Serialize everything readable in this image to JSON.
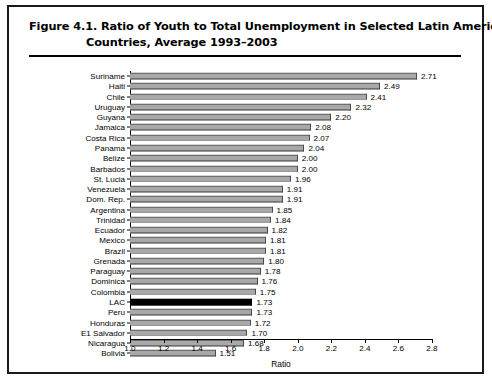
{
  "figure": {
    "label": "Figure 4.1.",
    "title_line1": "Figure 4.1.  Ratio of Youth to Total Unemployment in Selected Latin American",
    "title_line2": "Countries, Average 1993–2003"
  },
  "chart_data": {
    "type": "bar",
    "orientation": "horizontal",
    "title": "Figure 4.1.  Ratio of Youth to Total Unemployment in Selected Latin American Countries, Average 1993–2003",
    "xlabel": "Ratio",
    "ylabel": "",
    "xlim": [
      1.0,
      2.8
    ],
    "xticks": [
      "1.0",
      "1.2",
      "1.4",
      "1.6",
      "1.8",
      "2.0",
      "2.2",
      "2.4",
      "2.6",
      "2.8"
    ],
    "xtick_values": [
      1.0,
      1.2,
      1.4,
      1.6,
      1.8,
      2.0,
      2.2,
      2.4,
      2.6,
      2.8
    ],
    "grid": false,
    "legend": null,
    "highlight_category": "LAC",
    "highlight_color": "#000000",
    "bar_color": "#a8a8a8",
    "categories": [
      "Suriname",
      "Haiti",
      "Chile",
      "Uruguay",
      "Guyana",
      "Jamaica",
      "Costa Rica",
      "Panama",
      "Belize",
      "Barbados",
      "St. Lucia",
      "Venezuela",
      "Dom. Rep.",
      "Argentina",
      "Trinidad",
      "Ecuador",
      "Mexico",
      "Brazil",
      "Grenada",
      "Paraguay",
      "Dominica",
      "Colombia",
      "LAC",
      "Peru",
      "Honduras",
      "E1 Salvador",
      "Nicaragua",
      "Bolivia"
    ],
    "values": [
      2.71,
      2.49,
      2.41,
      2.32,
      2.2,
      2.08,
      2.07,
      2.04,
      2.0,
      2.0,
      1.96,
      1.91,
      1.91,
      1.85,
      1.84,
      1.82,
      1.81,
      1.81,
      1.8,
      1.78,
      1.76,
      1.75,
      1.73,
      1.73,
      1.72,
      1.7,
      1.68,
      1.51
    ],
    "value_labels": [
      "2.71",
      "2.49",
      "2.41",
      "2.32",
      "2.20",
      "2.08",
      "2.07",
      "2.04",
      "2.00",
      "2.00",
      "1.96",
      "1.91",
      "1.91",
      "1.85",
      "1.84",
      "1.82",
      "1.81",
      "1.81",
      "1.80",
      "1.78",
      "1.76",
      "1.75",
      "1.73",
      "1.73",
      "1.72",
      "1.70",
      "1.68",
      "1.51"
    ]
  }
}
